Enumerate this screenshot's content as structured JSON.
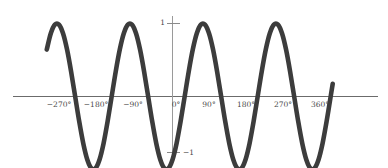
{
  "figure": {
    "width": 388,
    "height": 168,
    "background_color": "#ffffff"
  },
  "chart_data": {
    "type": "line",
    "title": "",
    "xlabel": "",
    "ylabel": "",
    "function": "sin(2x)",
    "grid": false,
    "legend": null,
    "curve_color": "#3c3c3c",
    "axis_color": "#6b6b6b",
    "xlim": [
      -330,
      400
    ],
    "ylim": [
      -1.25,
      1.25
    ],
    "x_tick_labels": [
      "−270°",
      "−180°",
      "−90°",
      "0°",
      "90°",
      "180°",
      "270°",
      "360°"
    ],
    "x_tick_values": [
      -270,
      -180,
      -90,
      0,
      90,
      180,
      270,
      360
    ],
    "y_tick_labels": [
      "1",
      "−1"
    ],
    "y_tick_values": [
      1,
      -1
    ],
    "x_domain_drawn": [
      -310,
      395
    ],
    "period_degrees": 180,
    "amplitude": 1,
    "peaks_x": [
      -135,
      45,
      225,
      405
    ],
    "troughs_x": [
      -225,
      -45,
      135,
      315
    ],
    "zeros_x": [
      -270,
      -180,
      -90,
      0,
      90,
      180,
      270,
      360
    ],
    "series": [
      {
        "name": "sin(2x)",
        "x": [
          -310,
          -300,
          -290,
          -280,
          -270,
          -260,
          -250,
          -240,
          -230,
          -220,
          -210,
          -200,
          -190,
          -180,
          -170,
          -160,
          -150,
          -140,
          -130,
          -120,
          -110,
          -100,
          -90,
          -80,
          -70,
          -60,
          -50,
          -40,
          -30,
          -20,
          -10,
          0,
          10,
          20,
          30,
          40,
          50,
          60,
          70,
          80,
          90,
          100,
          110,
          120,
          130,
          140,
          150,
          160,
          170,
          180,
          190,
          200,
          210,
          220,
          230,
          240,
          250,
          260,
          270,
          280,
          290,
          300,
          310,
          320,
          330,
          340,
          350,
          360,
          370,
          380,
          390,
          395
        ],
        "y": [
          0.643,
          0.866,
          0.985,
          0.985,
          0.866,
          0.643,
          0.342,
          0.0,
          -0.342,
          -0.643,
          -0.866,
          -0.985,
          -0.985,
          -0.866,
          -0.643,
          -0.342,
          0.0,
          0.342,
          0.643,
          0.866,
          0.985,
          0.985,
          0.866,
          0.643,
          0.342,
          0.0,
          -0.342,
          -0.643,
          -0.866,
          -0.985,
          -0.985,
          -0.866,
          -0.643,
          -0.342,
          0.0,
          0.342,
          0.643,
          0.866,
          0.985,
          0.985,
          0.866,
          0.643,
          0.342,
          0.0,
          -0.342,
          -0.643,
          -0.866,
          -0.985,
          -0.985,
          -0.866,
          -0.643,
          -0.342,
          0.0,
          0.342,
          0.643,
          0.866,
          0.985,
          0.985,
          0.866,
          0.643,
          0.342,
          0.0,
          -0.342,
          -0.643,
          -0.866,
          -0.985,
          -0.985,
          -0.866,
          -0.643,
          -0.342,
          0.0,
          0.174
        ]
      }
    ]
  },
  "axes": {
    "x_axis_label": "horizontal-axis",
    "y_axis_label": "vertical-axis"
  }
}
